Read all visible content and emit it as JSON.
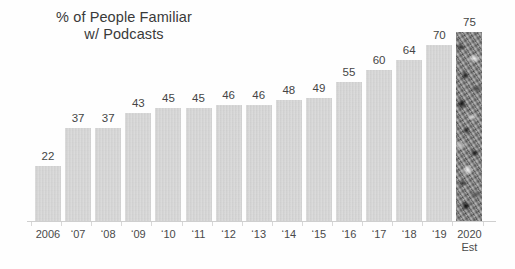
{
  "chart_data": {
    "type": "bar",
    "title": "% of People Familiar w/ Podcasts",
    "title_lines": [
      "% of People Familiar",
      "w/ Podcasts"
    ],
    "xlabel": "",
    "ylabel": "",
    "ylim": [
      0,
      80
    ],
    "grid": false,
    "legend": null,
    "categories": [
      "2006",
      "‘07",
      "‘08",
      "‘09",
      "‘10",
      "‘11",
      "‘12",
      "‘13",
      "‘14",
      "‘15",
      "‘16",
      "‘17",
      "‘18",
      "‘19",
      "2020"
    ],
    "category_sublabels": [
      "",
      "",
      "",
      "",
      "",
      "",
      "",
      "",
      "",
      "",
      "",
      "",
      "",
      "",
      "Est"
    ],
    "values": [
      22,
      37,
      37,
      43,
      45,
      45,
      46,
      46,
      48,
      49,
      55,
      60,
      64,
      70,
      75
    ],
    "value_labels": [
      "22",
      "37",
      "37",
      "43",
      "45",
      "45",
      "46",
      "46",
      "48",
      "49",
      "55",
      "60",
      "64",
      "70",
      "75"
    ],
    "bar_styles": [
      "plain",
      "plain",
      "plain",
      "plain",
      "plain",
      "plain",
      "plain",
      "plain",
      "plain",
      "plain",
      "plain",
      "plain",
      "plain",
      "plain",
      "textured"
    ],
    "colors": {
      "bar_fill": "#d2d2d2",
      "bar_fill_estimate": "#8a8a8a",
      "label_text": "#454545",
      "axis_line": "#cfcfcf",
      "background": "#fefefe",
      "title_text": "#3a3a3a"
    }
  }
}
